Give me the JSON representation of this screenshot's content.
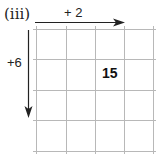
{
  "diagram": {
    "part_label": "(iii)",
    "horizontal_arrow_label": "+ 2",
    "vertical_arrow_label": "+6",
    "grid": {
      "columns": 4,
      "rows": 4,
      "line_color": "#b8b8b8"
    },
    "cells": [
      {
        "row": 1,
        "col": 2,
        "value": "15"
      }
    ],
    "arrow_color": "#222222"
  }
}
